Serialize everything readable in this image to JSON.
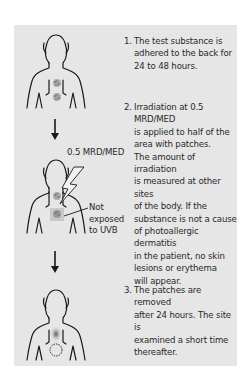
{
  "steps": [
    {
      "number": "1.",
      "text": "The test substance is\nadhered to the back for\n24 to 48 hours."
    },
    {
      "number": "2.",
      "text": "Irradiation at 0.5 MRD/MED\nis applied to half of the\narea with patches.\nThe amount of irradiation\nis measured at other sites\nof the body. If the\nsubstance is not a cause\nof photoallergic dermatitis\nin the patient, no skin\nlesions or erythema\nwill appear."
    },
    {
      "number": "3.",
      "text": "The patches are removed\nafter 24 hours. The site is\nexamined a short time\nthereafter."
    }
  ],
  "figure2": {
    "dose_label": "0.5 MRD/MED",
    "not_exposed_label": "Not\nexposed\nto UVB"
  },
  "icons": {
    "torso": "human-torso-outline",
    "patch": "patch-test-spot",
    "arrow": "down-arrow",
    "uv": "lightning-bolt"
  },
  "colors": {
    "panel": "#e6e6e6",
    "line": "#1a1a1a",
    "text": "#2a2a2a"
  }
}
